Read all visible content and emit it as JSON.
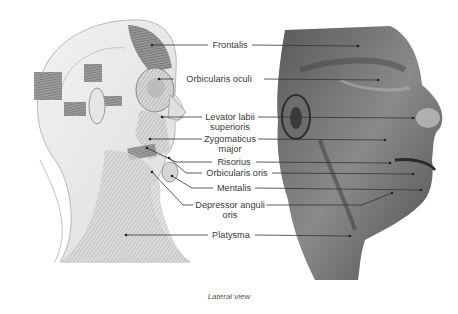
{
  "figure": {
    "caption": "Lateral view",
    "left_panel": "Illustrated head and neck, lateral view, showing facial muscles",
    "right_panel": "Dissected cadaver face, lateral view"
  },
  "labels": [
    {
      "id": "frontalis",
      "text": "Frontalis",
      "line2": ""
    },
    {
      "id": "orbicularis-oculi",
      "text": "Orbicularis oculi",
      "line2": ""
    },
    {
      "id": "levator-labii-superioris",
      "text": "Levator labii",
      "line2": "superioris"
    },
    {
      "id": "zygomaticus-major",
      "text": "Zygomaticus",
      "line2": "major"
    },
    {
      "id": "risorius",
      "text": "Risorius",
      "line2": ""
    },
    {
      "id": "orbicularis-oris",
      "text": "Orbicularis oris",
      "line2": ""
    },
    {
      "id": "mentalis",
      "text": "Mentalis",
      "line2": ""
    },
    {
      "id": "depressor-anguli-oris",
      "text": "Depressor anguli",
      "line2": "oris"
    },
    {
      "id": "platysma",
      "text": "Platysma",
      "line2": ""
    }
  ],
  "colors": {
    "leader_line": "#333333",
    "text": "#3a3a3a",
    "background": "#ffffff"
  }
}
